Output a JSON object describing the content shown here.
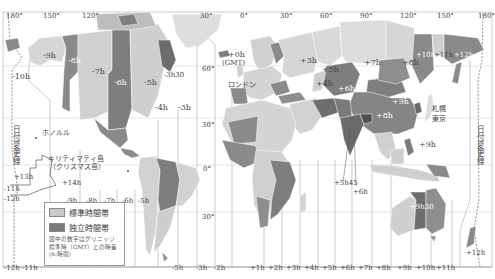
{
  "map": {
    "title": "世界の時差（標準時帯）",
    "colors": {
      "ocean": "#ffffff",
      "standard_zone": "#c9c9c9",
      "independent_zone": "#7b7b7b",
      "light_land": "#dcdcdc",
      "zone_line": "#9a9a9a",
      "border": "#ffffff",
      "text": "#444444"
    },
    "longitude_labels": [
      {
        "text": "180°",
        "x": 6,
        "y": 13
      },
      {
        "text": "150°",
        "x": 43,
        "y": 13
      },
      {
        "text": "120°",
        "x": 82,
        "y": 13
      },
      {
        "text": "30°",
        "x": 200,
        "y": 13
      },
      {
        "text": "0°",
        "x": 240,
        "y": 13
      },
      {
        "text": "30°",
        "x": 280,
        "y": 13
      },
      {
        "text": "60°",
        "x": 320,
        "y": 13
      },
      {
        "text": "90°",
        "x": 360,
        "y": 13
      },
      {
        "text": "120°",
        "x": 400,
        "y": 13
      },
      {
        "text": "150°",
        "x": 437,
        "y": 13
      },
      {
        "text": "180°",
        "x": 480,
        "y": 13
      }
    ],
    "latitude_labels": [
      {
        "text": "60°",
        "x": 202,
        "y": 66
      },
      {
        "text": "30°",
        "x": 202,
        "y": 122
      },
      {
        "text": "0°",
        "x": 203,
        "y": 166
      },
      {
        "text": "30°",
        "x": 202,
        "y": 214
      }
    ],
    "zone_labels": [
      {
        "text": "-9h",
        "x": 43,
        "y": 52,
        "dark": false
      },
      {
        "text": "-8h",
        "x": 69,
        "y": 57,
        "dark": true
      },
      {
        "text": "-7h",
        "x": 92,
        "y": 68,
        "dark": false
      },
      {
        "text": "-6h",
        "x": 114,
        "y": 79,
        "dark": true
      },
      {
        "text": "-5h",
        "x": 144,
        "y": 79,
        "dark": false
      },
      {
        "text": "-10h",
        "x": 12,
        "y": 73,
        "dark": false
      },
      {
        "text": "-3h30",
        "x": 164,
        "y": 72,
        "dark": false
      },
      {
        "text": "-4h",
        "x": 157,
        "y": 104,
        "dark": false
      },
      {
        "text": "-3h",
        "x": 180,
        "y": 104,
        "dark": false
      },
      {
        "text": "+0h",
        "x": 226,
        "y": 53,
        "dark": false
      },
      {
        "text": "(GMT)",
        "x": 222,
        "y": 61,
        "dark": false
      },
      {
        "text": "+3h",
        "x": 300,
        "y": 57,
        "dark": false
      },
      {
        "text": "+4h",
        "x": 318,
        "y": 80,
        "dark": false
      },
      {
        "text": "+5h",
        "x": 322,
        "y": 66,
        "dark": false
      },
      {
        "text": "+6h",
        "x": 340,
        "y": 85,
        "dark": true
      },
      {
        "text": "+7h",
        "x": 364,
        "y": 59,
        "dark": false
      },
      {
        "text": "+8h",
        "x": 402,
        "y": 59,
        "dark": false
      },
      {
        "text": "+9h",
        "x": 421,
        "y": 78,
        "dark": true
      },
      {
        "text": "+10h",
        "x": 420,
        "y": 51,
        "dark": true
      },
      {
        "text": "+11h",
        "x": 440,
        "y": 51,
        "dark": false
      },
      {
        "text": "+12h",
        "x": 459,
        "y": 51,
        "dark": true
      },
      {
        "text": "+8h",
        "x": 374,
        "y": 112,
        "dark": true
      },
      {
        "text": "+9h",
        "x": 419,
        "y": 141,
        "dark": false
      },
      {
        "text": "+5h45",
        "x": 334,
        "y": 181,
        "dark": false
      },
      {
        "text": "+6h",
        "x": 353,
        "y": 189,
        "dark": false
      },
      {
        "text": "+9h30",
        "x": 414,
        "y": 204,
        "dark": true
      },
      {
        "text": "+12h",
        "x": 467,
        "y": 248,
        "dark": false
      },
      {
        "text": "+13h",
        "x": 12,
        "y": 184,
        "dark": false
      },
      {
        "text": "+14h",
        "x": 64,
        "y": 181,
        "dark": false
      },
      {
        "text": "-11h",
        "x": 2,
        "y": 196,
        "dark": false
      },
      {
        "text": "-12h",
        "x": 2,
        "y": 205,
        "dark": false
      }
    ],
    "place_labels": [
      {
        "text": "ロンドン",
        "x": 228,
        "y": 82
      },
      {
        "text": "札幌",
        "x": 428,
        "y": 106
      },
      {
        "text": "東京",
        "x": 428,
        "y": 116
      },
      {
        "text": "ホノルル",
        "x": 40,
        "y": 132
      },
      {
        "text": "キリティマティ島",
        "x": 48,
        "y": 154
      },
      {
        "text": "（クリスマス島）",
        "x": 49,
        "y": 163
      }
    ],
    "dateline_labels": [
      {
        "text": "日付変更線",
        "x": 12,
        "y": 130
      },
      {
        "text": "日付変更線",
        "x": 479,
        "y": 130
      }
    ],
    "bottom_offsets": [
      "-12h",
      "-11h",
      "-9h",
      "-8h",
      "-7h",
      "-6h",
      "-5h",
      "-3h",
      "-2h",
      "-1h",
      "+1h",
      "+2h",
      "+3h",
      "+4h",
      "+5h",
      "+6h",
      "+7h",
      "+8h",
      "+9h",
      "+10h",
      "+11h"
    ],
    "mid_offsets": [
      "-9h",
      "-8h",
      "-7h",
      "-6h",
      "-5h"
    ]
  },
  "legend": {
    "items": [
      {
        "label": "標準時間帯",
        "swatch": "standard"
      },
      {
        "label": "独立時間帯",
        "swatch": "independent"
      }
    ],
    "note_line1": "図中の数字はグリニッジ",
    "note_line2": "標準時（GMT）との時差",
    "note_line3": "(h:時間)"
  }
}
